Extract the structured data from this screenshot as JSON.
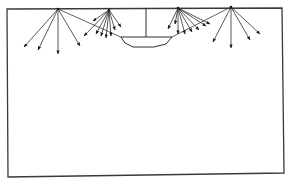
{
  "diagram": {
    "title": "",
    "colors": {
      "line": "#2e2e2e",
      "background": "#ffffff"
    },
    "room": {
      "corners": [
        [
          7,
          9
        ],
        [
          282,
          8
        ],
        [
          284,
          173
        ],
        [
          8,
          177
        ]
      ]
    },
    "lamp": {
      "rod": {
        "x": 146,
        "y1": 8,
        "y2": 37
      },
      "bowl": [
        [
          121,
          37
        ],
        [
          172,
          37
        ],
        [
          166,
          44
        ],
        [
          154,
          47
        ],
        [
          133,
          47
        ],
        [
          125,
          43
        ]
      ]
    },
    "reflection_lines": [
      {
        "from": [
          58,
          9
        ],
        "to": [
          123,
          38
        ]
      },
      {
        "from": [
          231,
          7
        ],
        "to": [
          170,
          38
        ]
      }
    ],
    "sources": [
      {
        "id": "A",
        "at": [
          58,
          9
        ],
        "arrows_to": [
          [
            24,
            47
          ],
          [
            38,
            50
          ],
          [
            58,
            54
          ],
          [
            80,
            46
          ]
        ]
      },
      {
        "id": "B",
        "at": [
          109,
          10
        ],
        "arrows_to": [
          [
            84,
            36
          ],
          [
            96,
            34
          ],
          [
            101,
            36
          ],
          [
            106,
            38
          ],
          [
            111,
            36
          ],
          [
            115,
            30
          ],
          [
            121,
            27
          ],
          [
            93,
            21
          ]
        ]
      },
      {
        "id": "C",
        "at": [
          178,
          8
        ],
        "arrows_to": [
          [
            168,
            29
          ],
          [
            178,
            34
          ],
          [
            185,
            34
          ],
          [
            192,
            32
          ],
          [
            199,
            30
          ],
          [
            206,
            26
          ],
          [
            210,
            24
          ],
          [
            175,
            24
          ]
        ]
      },
      {
        "id": "D",
        "at": [
          231,
          7
        ],
        "arrows_to": [
          [
            213,
            42
          ],
          [
            231,
            48
          ],
          [
            250,
            40
          ],
          [
            260,
            34
          ]
        ]
      }
    ]
  }
}
